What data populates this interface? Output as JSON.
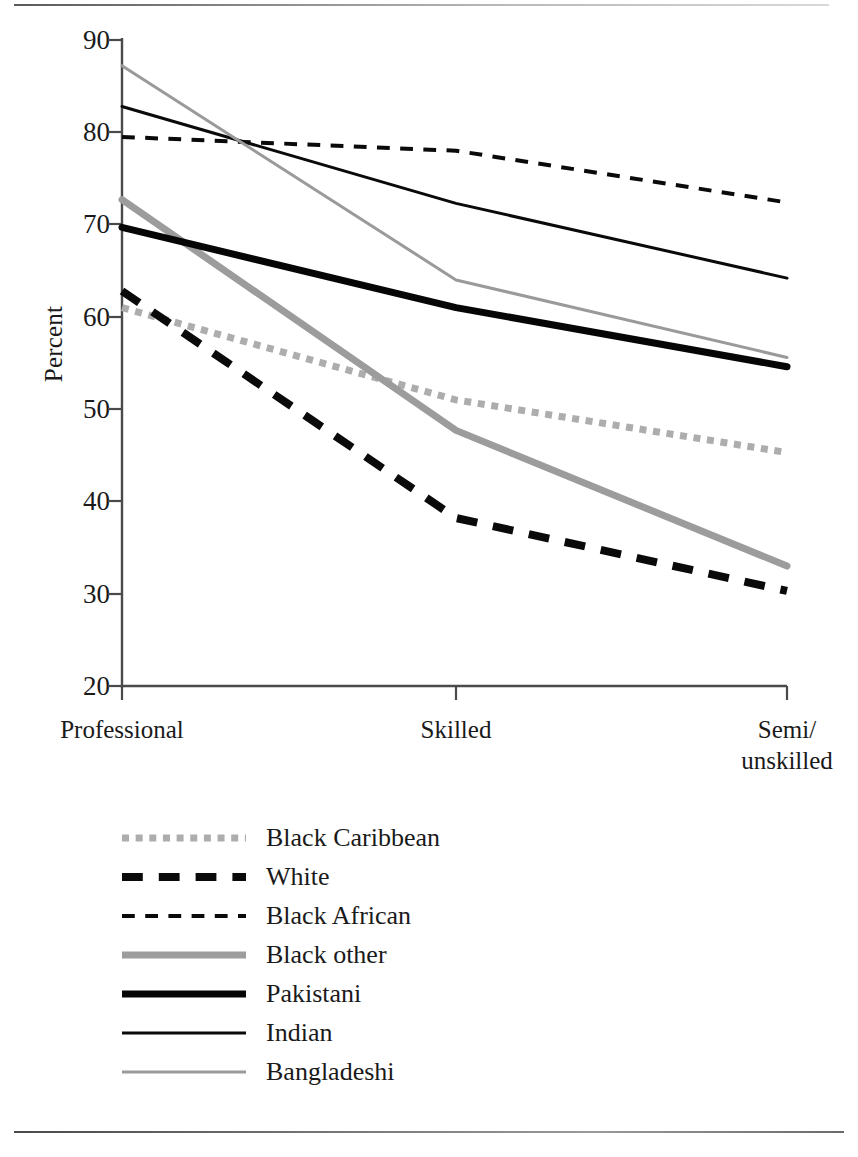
{
  "chart_data": {
    "type": "line",
    "title": "",
    "xlabel": "",
    "ylabel": "Percent",
    "categories": [
      "Professional",
      "Skilled",
      "Semi/\nunskilled"
    ],
    "category_labels_flat": [
      "Professional",
      "Skilled",
      "Semi/unskilled"
    ],
    "ylim": [
      20,
      90
    ],
    "yticks": [
      20,
      30,
      40,
      50,
      60,
      70,
      80,
      90
    ],
    "ytick_labels": [
      "20",
      "30",
      "40",
      "50",
      "60",
      "70",
      "80",
      "90"
    ],
    "grid": false,
    "legend_position": "below",
    "series": [
      {
        "name": "Black Caribbean",
        "values": [
          61.0,
          51.0,
          45.3
        ],
        "style": "dotted",
        "color": "#adadad",
        "width": 7
      },
      {
        "name": "White",
        "values": [
          62.8,
          38.2,
          30.3
        ],
        "style": "dashed",
        "color": "#0a0a0a",
        "width": 8
      },
      {
        "name": "Black African",
        "values": [
          79.5,
          78.0,
          72.4
        ],
        "style": "dashed-thin",
        "color": "#0a0a0a",
        "width": 4
      },
      {
        "name": "Black other",
        "values": [
          72.7,
          47.7,
          33.0
        ],
        "style": "solid",
        "color": "#9c9c9c",
        "width": 7
      },
      {
        "name": "Pakistani",
        "values": [
          69.7,
          61.0,
          54.6
        ],
        "style": "solid",
        "color": "#060606",
        "width": 7
      },
      {
        "name": "Indian",
        "values": [
          82.8,
          72.3,
          64.2
        ],
        "style": "solid",
        "color": "#0a0a0a",
        "width": 3
      },
      {
        "name": "Bangladeshi",
        "values": [
          87.2,
          64.0,
          55.6
        ],
        "style": "solid",
        "color": "#9a9a9a",
        "width": 3
      }
    ]
  },
  "axis": {
    "y_axis_name": "Percent"
  },
  "legend": {
    "items": [
      "Black Caribbean",
      "White",
      "Black African",
      "Black other",
      "Pakistani",
      "Indian",
      "Bangladeshi"
    ]
  }
}
